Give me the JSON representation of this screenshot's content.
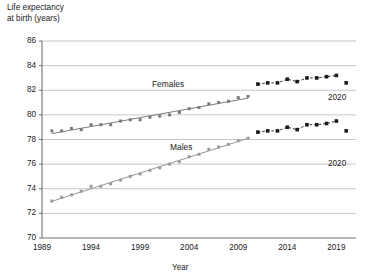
{
  "chart_data": {
    "type": "scatter",
    "title": "",
    "ylabel": "Life expectancy\nat birth (years)",
    "xlabel": "Year",
    "ylim": [
      70,
      86
    ],
    "xlim": [
      1989,
      2021
    ],
    "yticks": [
      70,
      72,
      74,
      76,
      78,
      80,
      82,
      84,
      86
    ],
    "xticks": [
      1989,
      1994,
      1999,
      2004,
      2009,
      2014,
      2019
    ],
    "grid": true,
    "legend_position": "inline-labels",
    "annotations": [
      {
        "text": "2020",
        "series": "Females",
        "x": 2020,
        "y": 82.6
      },
      {
        "text": "2020",
        "series": "Males",
        "x": 2020,
        "y": 78.7
      }
    ],
    "series": [
      {
        "name": "Females",
        "label": "Females",
        "color": "#7a7a7a",
        "trend_color": "#6e6e6e",
        "style_early": "grey-markers-with-trendline",
        "style_late": "dark-markers-connected",
        "late_start_year": 2011,
        "x": [
          1990,
          1991,
          1992,
          1993,
          1994,
          1995,
          1996,
          1997,
          1998,
          1999,
          2000,
          2001,
          2002,
          2003,
          2004,
          2005,
          2006,
          2007,
          2008,
          2009,
          2010,
          2011,
          2012,
          2013,
          2014,
          2015,
          2016,
          2017,
          2018,
          2019,
          2020
        ],
        "y": [
          78.7,
          78.7,
          78.9,
          78.8,
          79.2,
          79.2,
          79.2,
          79.5,
          79.6,
          79.6,
          79.8,
          79.9,
          80.0,
          80.2,
          80.5,
          80.6,
          80.9,
          81.0,
          81.1,
          81.4,
          81.5,
          82.5,
          82.6,
          82.6,
          82.9,
          82.7,
          83.0,
          83.0,
          83.1,
          83.2,
          82.6
        ]
      },
      {
        "name": "Males",
        "label": "Males",
        "color": "#9a9a9a",
        "trend_color": "#8a8a8a",
        "style_early": "grey-markers-with-trendline",
        "style_late": "dark-markers-connected",
        "late_start_year": 2011,
        "x": [
          1990,
          1991,
          1992,
          1993,
          1994,
          1995,
          1996,
          1997,
          1998,
          1999,
          2000,
          2001,
          2002,
          2003,
          2004,
          2005,
          2006,
          2007,
          2008,
          2009,
          2010,
          2011,
          2012,
          2013,
          2014,
          2015,
          2016,
          2017,
          2018,
          2019,
          2020
        ],
        "y": [
          73.0,
          73.3,
          73.5,
          73.8,
          74.2,
          74.2,
          74.4,
          74.7,
          75.0,
          75.2,
          75.5,
          75.7,
          76.0,
          76.2,
          76.6,
          76.8,
          77.2,
          77.4,
          77.6,
          77.9,
          78.1,
          78.6,
          78.7,
          78.7,
          79.0,
          78.8,
          79.2,
          79.2,
          79.3,
          79.5,
          78.7
        ]
      }
    ]
  },
  "axes": {
    "y_title": "Life expectancy\nat birth (years)",
    "x_title": "Year",
    "y_tick_labels": [
      "86",
      "84",
      "82",
      "80",
      "78",
      "76",
      "74",
      "72",
      "70"
    ],
    "x_tick_labels": [
      "1989",
      "1994",
      "1999",
      "2004",
      "2009",
      "2014",
      "2019"
    ]
  },
  "labels": {
    "females": "Females",
    "males": "Males",
    "annot_females_2020": "2020",
    "annot_males_2020": "2020"
  },
  "colors": {
    "grid": "#b9b9b9",
    "axis": "#707070",
    "marker_early": "#8d8d8d",
    "marker_late": "#1b1b1b",
    "text": "#1a1a1a"
  }
}
